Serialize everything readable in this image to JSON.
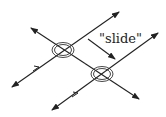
{
  "diagram": {
    "label": "\"slide\"",
    "colors": {
      "stroke": "#222222",
      "background": "#ffffff"
    },
    "lines": {
      "parallel_upper": {
        "from": [
          12,
          87
        ],
        "to": [
          119,
          12
        ]
      },
      "parallel_lower": {
        "from": [
          52,
          110
        ],
        "to": [
          158,
          33
        ]
      },
      "transversal": {
        "from": [
          31,
          28
        ],
        "to": [
          139,
          99
        ]
      }
    },
    "intersections": [
      {
        "center": [
          63,
          50
        ],
        "rx": 11,
        "ry": 7
      },
      {
        "center": [
          102,
          74
        ],
        "rx": 11,
        "ry": 8
      }
    ],
    "slide_arrow": {
      "from": [
        88,
        39
      ],
      "to": [
        115,
        59
      ]
    }
  }
}
